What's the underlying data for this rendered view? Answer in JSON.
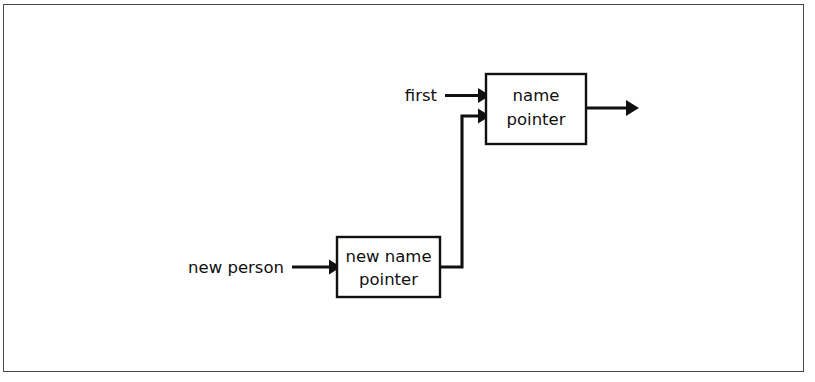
{
  "figure": {
    "type": "diagram",
    "subtype": "linked-list-pointer-diagram",
    "background_color": "#ffffff",
    "frame": {
      "name": "figure-border",
      "border_color": "#4a4a4a",
      "fill": "#ffffff"
    },
    "stroke_color": "#101010",
    "text_color": "#101010"
  },
  "nodes": [
    {
      "id": "name-pointer-node",
      "name": "name-pointer-box",
      "lines": [
        "name",
        "pointer"
      ],
      "line1": "name",
      "line2": "pointer",
      "x": 486,
      "y": 74,
      "width": 100,
      "height": 70
    },
    {
      "id": "new-name-pointer-node",
      "name": "new-name-pointer-box",
      "lines": [
        "new name",
        "pointer"
      ],
      "line1": "new name",
      "line2": "pointer",
      "x": 337,
      "y": 237,
      "width": 103,
      "height": 60
    }
  ],
  "labels": {
    "first": "first",
    "new_person": "new person"
  },
  "edges": [
    {
      "id": "first-to-name-pointer",
      "name": "first-pointer-arrow",
      "label": "first",
      "from": "first-label",
      "to": "name-pointer-box",
      "arrowhead": true
    },
    {
      "id": "new-person-to-new-name-pointer",
      "name": "new-person-pointer-arrow",
      "label": "new person",
      "from": "new-person-label",
      "to": "new-name-pointer-box",
      "arrowhead": true
    },
    {
      "id": "new-name-pointer-to-name-pointer",
      "name": "link-arrow",
      "label": "",
      "from": "new-name-pointer-box",
      "to": "name-pointer-box",
      "routing": "orthogonal",
      "arrowhead": true
    },
    {
      "id": "name-pointer-to-next",
      "name": "next-node-arrow",
      "label": "",
      "from": "name-pointer-box",
      "to": "next",
      "arrowhead": true
    }
  ]
}
